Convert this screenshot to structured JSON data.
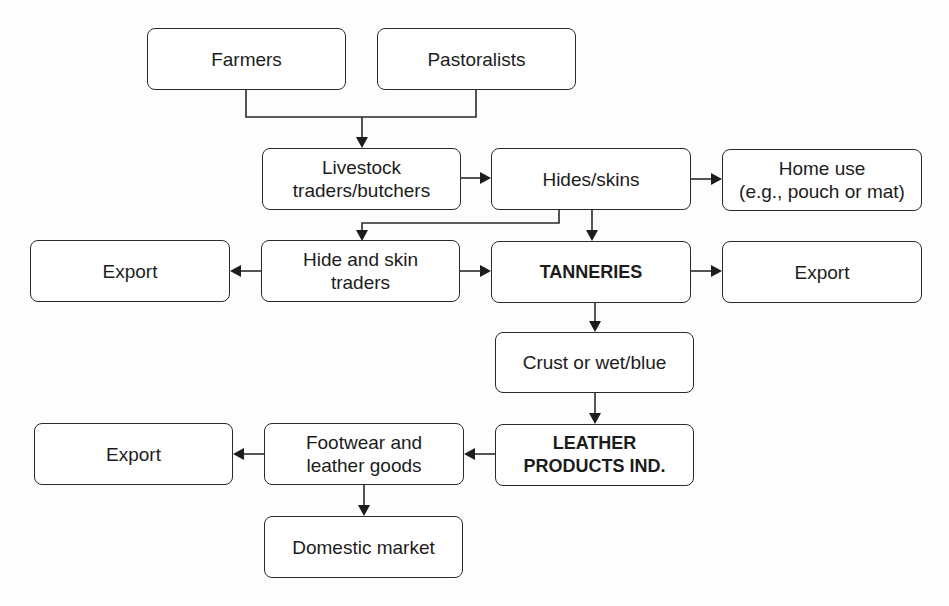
{
  "diagram": {
    "type": "flowchart",
    "nodes": [
      {
        "id": "farmers",
        "label": "Farmers",
        "bold": false
      },
      {
        "id": "pastoralists",
        "label": "Pastoralists",
        "bold": false
      },
      {
        "id": "livestock",
        "label": "Livestock\ntraders/butchers",
        "bold": false
      },
      {
        "id": "hides",
        "label": "Hides/skins",
        "bold": false
      },
      {
        "id": "home_use",
        "label": "Home use\n(e.g., pouch or mat)",
        "bold": false
      },
      {
        "id": "export_left",
        "label": "Export",
        "bold": false
      },
      {
        "id": "hide_traders",
        "label": "Hide and skin\ntraders",
        "bold": false
      },
      {
        "id": "tanneries",
        "label": "TANNERIES",
        "bold": true
      },
      {
        "id": "export_right",
        "label": "Export",
        "bold": false
      },
      {
        "id": "crust",
        "label": "Crust or wet/blue",
        "bold": false
      },
      {
        "id": "export_bottom",
        "label": "Export",
        "bold": false
      },
      {
        "id": "footwear",
        "label": "Footwear and\nleather goods",
        "bold": false
      },
      {
        "id": "leather_products",
        "label": "LEATHER\nPRODUCTS IND.",
        "bold": true
      },
      {
        "id": "domestic",
        "label": "Domestic market",
        "bold": false
      }
    ],
    "edges": [
      {
        "from": "farmers",
        "to": "livestock"
      },
      {
        "from": "pastoralists",
        "to": "livestock"
      },
      {
        "from": "livestock",
        "to": "hides"
      },
      {
        "from": "hides",
        "to": "home_use"
      },
      {
        "from": "hides",
        "to": "hide_traders"
      },
      {
        "from": "hides",
        "to": "tanneries"
      },
      {
        "from": "hide_traders",
        "to": "export_left"
      },
      {
        "from": "hide_traders",
        "to": "tanneries"
      },
      {
        "from": "tanneries",
        "to": "export_right"
      },
      {
        "from": "tanneries",
        "to": "crust"
      },
      {
        "from": "crust",
        "to": "leather_products"
      },
      {
        "from": "leather_products",
        "to": "footwear"
      },
      {
        "from": "footwear",
        "to": "export_bottom"
      },
      {
        "from": "footwear",
        "to": "domestic"
      }
    ]
  }
}
